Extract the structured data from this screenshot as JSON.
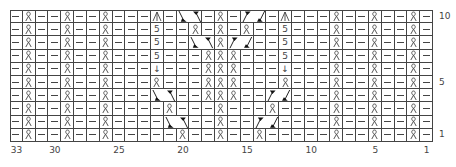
{
  "chart_title": "",
  "grid": {
    "columns": 33,
    "rows": 10,
    "column_order": "right-to-left, column 1 at right",
    "row_order": "bottom-to-top, row 1 at bottom"
  },
  "row_labels": [
    {
      "row": 10,
      "text": "10"
    },
    {
      "row": 5,
      "text": "5"
    },
    {
      "row": 1,
      "text": "1"
    }
  ],
  "column_labels": [
    {
      "col": 33,
      "text": "33"
    },
    {
      "col": 30,
      "text": "30"
    },
    {
      "col": 25,
      "text": "25"
    },
    {
      "col": 20,
      "text": "20"
    },
    {
      "col": 15,
      "text": "15"
    },
    {
      "col": 10,
      "text": "10"
    },
    {
      "col": 5,
      "text": "5"
    },
    {
      "col": 1,
      "text": "1"
    }
  ],
  "symbols": {
    "P": "purl-dash",
    "Q": "twisted-knit",
    "K": "blank-knit",
    "A": "centered-double-decrease",
    "S": "five-stitch-bobble-5",
    "V": "increase-from-one",
    "CL": "cable-left-cross-2st",
    "CR": "cable-right-cross-2st"
  },
  "symbol_text": {
    "S": "5",
    "V": "↓"
  },
  "rows_top_to_bottom": [
    "PQPPQPPQPPPAPCL_PQPCR_PAPPPQPPQPPQP",
    "",
    ""
  ],
  "cells": [
    {
      "row": 10,
      "pattern": [
        "P",
        "Q",
        "P",
        "P",
        "Q",
        "P",
        "P",
        "Q",
        "P",
        "P",
        "P",
        "A",
        "P",
        "CR",
        "CR",
        "P",
        "Q",
        "P",
        "CL",
        "CL",
        "P",
        "A",
        "P",
        "P",
        "P",
        "Q",
        "P",
        "P",
        "Q",
        "P",
        "P",
        "Q",
        "P"
      ]
    },
    {
      "row": 9,
      "pattern": [
        "P",
        "Q",
        "P",
        "P",
        "Q",
        "P",
        "P",
        "Q",
        "P",
        "P",
        "P",
        "S",
        "P",
        "P",
        "Q",
        "P",
        "Q",
        "P",
        "Q",
        "P",
        "P",
        "S",
        "P",
        "P",
        "P",
        "Q",
        "P",
        "P",
        "Q",
        "P",
        "P",
        "Q",
        "P"
      ]
    },
    {
      "row": 8,
      "pattern": [
        "P",
        "Q",
        "P",
        "P",
        "Q",
        "P",
        "P",
        "Q",
        "P",
        "P",
        "P",
        "S",
        "P",
        "P",
        "CR",
        "CR",
        "Q",
        "CL",
        "CL",
        "P",
        "P",
        "S",
        "P",
        "P",
        "P",
        "Q",
        "P",
        "P",
        "Q",
        "P",
        "P",
        "Q",
        "P"
      ]
    },
    {
      "row": 7,
      "pattern": [
        "P",
        "Q",
        "P",
        "P",
        "Q",
        "P",
        "P",
        "Q",
        "P",
        "P",
        "P",
        "S",
        "P",
        "P",
        "P",
        "Q",
        "Q",
        "Q",
        "P",
        "P",
        "P",
        "S",
        "P",
        "P",
        "P",
        "Q",
        "P",
        "P",
        "Q",
        "P",
        "P",
        "Q",
        "P"
      ]
    },
    {
      "row": 6,
      "pattern": [
        "P",
        "Q",
        "P",
        "P",
        "Q",
        "P",
        "P",
        "Q",
        "P",
        "P",
        "P",
        "V",
        "P",
        "P",
        "P",
        "Q",
        "Q",
        "Q",
        "P",
        "P",
        "P",
        "V",
        "P",
        "P",
        "P",
        "Q",
        "P",
        "P",
        "Q",
        "P",
        "P",
        "Q",
        "P"
      ]
    },
    {
      "row": 5,
      "pattern": [
        "P",
        "Q",
        "P",
        "P",
        "Q",
        "P",
        "P",
        "Q",
        "P",
        "P",
        "P",
        "Q",
        "P",
        "P",
        "P",
        "Q",
        "Q",
        "Q",
        "P",
        "P",
        "P",
        "Q",
        "P",
        "P",
        "P",
        "Q",
        "P",
        "P",
        "Q",
        "P",
        "P",
        "Q",
        "P"
      ]
    },
    {
      "row": 4,
      "pattern": [
        "P",
        "Q",
        "P",
        "P",
        "Q",
        "P",
        "P",
        "Q",
        "P",
        "P",
        "P",
        "CR",
        "CR",
        "P",
        "P",
        "Q",
        "Q",
        "Q",
        "P",
        "P",
        "CL",
        "CL",
        "P",
        "P",
        "P",
        "Q",
        "P",
        "P",
        "Q",
        "P",
        "P",
        "Q",
        "P"
      ]
    },
    {
      "row": 3,
      "pattern": [
        "P",
        "Q",
        "P",
        "P",
        "Q",
        "P",
        "P",
        "Q",
        "P",
        "P",
        "P",
        "P",
        "Q",
        "P",
        "P",
        "P",
        "Q",
        "P",
        "P",
        "P",
        "Q",
        "P",
        "P",
        "P",
        "P",
        "Q",
        "P",
        "P",
        "Q",
        "P",
        "P",
        "Q",
        "P"
      ]
    },
    {
      "row": 2,
      "pattern": [
        "P",
        "Q",
        "P",
        "P",
        "Q",
        "P",
        "P",
        "Q",
        "P",
        "P",
        "P",
        "P",
        "CR",
        "CR",
        "P",
        "P",
        "Q",
        "P",
        "P",
        "CL",
        "CL",
        "P",
        "P",
        "P",
        "P",
        "Q",
        "P",
        "P",
        "Q",
        "P",
        "P",
        "Q",
        "P"
      ]
    },
    {
      "row": 1,
      "pattern": [
        "P",
        "Q",
        "P",
        "P",
        "Q",
        "P",
        "P",
        "Q",
        "P",
        "P",
        "P",
        "P",
        "P",
        "Q",
        "P",
        "P",
        "Q",
        "P",
        "P",
        "Q",
        "P",
        "P",
        "P",
        "P",
        "P",
        "Q",
        "P",
        "P",
        "Q",
        "P",
        "P",
        "Q",
        "P"
      ]
    }
  ],
  "colors": {
    "grid_line": "#444444",
    "symbol": "#444444",
    "background": "#ffffff",
    "cable_marker": "#111111"
  }
}
